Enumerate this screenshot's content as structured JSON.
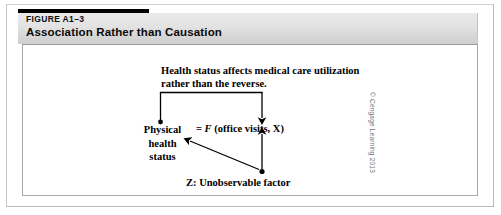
{
  "figure": {
    "number": "FIGURE A1–3",
    "title": "Association Rather than Causation"
  },
  "diagram": {
    "annotation": {
      "line1": "Health status affects medical care utilization",
      "line2": "rather than the reverse."
    },
    "physical_node": {
      "line1": "Physical",
      "line2": "health",
      "line3": "status"
    },
    "formula": {
      "equals": "=",
      "function_name": "F",
      "arguments": "(office visits, X)"
    },
    "z_node": {
      "label": "Z: Unobservable factor"
    }
  },
  "copyright": {
    "text": "© Cengage Learning 2013"
  },
  "colors": {
    "rule": "#000000",
    "header_band_top": "#e9e9e9",
    "header_band_bottom": "#cfcfcf",
    "frame_border": "#b9b9b9",
    "diagram_border": "#a9a9a9",
    "ink": "#000000",
    "copyright_text": "#6e6e6e"
  }
}
